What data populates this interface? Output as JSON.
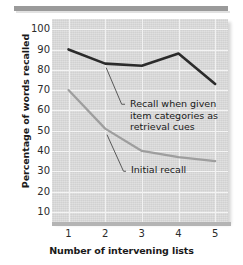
{
  "chart_data": {
    "type": "line",
    "title": "",
    "xlabel": "Number of intervening lists",
    "ylabel": "Percentage of words recalled",
    "categories": [
      "1",
      "2",
      "3",
      "4",
      "5"
    ],
    "x": [
      1,
      2,
      3,
      4,
      5
    ],
    "xlim": [
      0.55,
      5.35
    ],
    "ylim": [
      5,
      105
    ],
    "yticks": [
      10,
      20,
      30,
      40,
      50,
      60,
      70,
      80,
      90,
      100
    ],
    "ytick_labels": [
      "10",
      "20",
      "30",
      "40",
      "50",
      "60",
      "70",
      "80",
      "90",
      "100"
    ],
    "grid": "horizontal-and-vertical-white-on-gray",
    "legend": "inline-annotations",
    "series": [
      {
        "name": "Recall when given item categories as retrieval cues",
        "short_name": "cued-recall",
        "color": "#2b2b2b",
        "width": 2.6,
        "values": [
          90,
          83,
          82,
          88,
          73
        ]
      },
      {
        "name": "Initial recall",
        "short_name": "initial-recall",
        "color": "#9e9e9e",
        "width": 2.2,
        "values": [
          70,
          51,
          40,
          37,
          35
        ]
      }
    ],
    "annotations": [
      {
        "id": "cued",
        "text": "Recall when given\nitem categories as\nretrieval cues",
        "points_to_series": "cued-recall"
      },
      {
        "id": "initial",
        "text": "Initial recall",
        "points_to_series": "initial-recall"
      }
    ],
    "colors": {
      "plot_background": "#dcdcdc",
      "gridline": "#f4f4f4",
      "cued_line": "#2b2b2b",
      "initial_line": "#9e9e9e",
      "rule": "#9a9a9a",
      "text": "#1a1a1a"
    }
  }
}
